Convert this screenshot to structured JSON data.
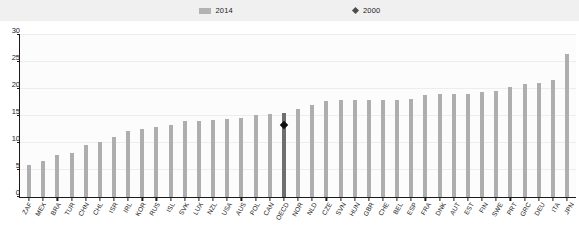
{
  "legend": {
    "items": [
      {
        "label": "2014",
        "marker": "bar-swatch-icon",
        "color": "#b3b3b3"
      },
      {
        "label": "2000",
        "marker": "diamond-marker-icon",
        "color": "#4d4d4d"
      }
    ]
  },
  "chart_data": {
    "type": "bar",
    "title": "",
    "subtitle": "",
    "xlabel": "",
    "ylabel": "",
    "ylim": [
      0,
      30
    ],
    "yticks": [
      0,
      5,
      10,
      15,
      20,
      25,
      30
    ],
    "grid": true,
    "legend_position": "top-center",
    "highlight_category": "OECD",
    "categories": [
      "ZAF",
      "MEX",
      "BRA",
      "TUR",
      "CHN",
      "CHL",
      "ISR",
      "IRL",
      "KOR",
      "RUS",
      "ISL",
      "SVK",
      "LUX",
      "NZL",
      "USA",
      "AUS",
      "POL",
      "CAN",
      "OECD",
      "NOR",
      "NLD",
      "CZE",
      "SVN",
      "HUN",
      "GBR",
      "CHE",
      "BEL",
      "ESP",
      "FRA",
      "DNK",
      "AUT",
      "EST",
      "FIN",
      "SWE",
      "PRT",
      "GRC",
      "DEU",
      "ITA",
      "JPN"
    ],
    "series": [
      {
        "name": "2014",
        "type": "bar",
        "color": "#aeaeae",
        "values": [
          5.9,
          6.7,
          7.7,
          8.2,
          9.6,
          10.2,
          11.1,
          12.3,
          12.6,
          13.0,
          13.4,
          14.0,
          14.1,
          14.3,
          14.4,
          14.6,
          15.2,
          15.4,
          15.6,
          16.3,
          17.1,
          17.7,
          17.9,
          17.9,
          17.9,
          17.9,
          18.0,
          18.1,
          18.8,
          19.0,
          19.0,
          19.1,
          19.5,
          19.7,
          20.3,
          21.0,
          21.2,
          21.6,
          26.5
        ]
      },
      {
        "name": "2000",
        "type": "scatter",
        "marker": "diamond",
        "color": "#101010",
        "points": [
          {
            "category": "OECD",
            "value": 13.3
          }
        ]
      }
    ]
  }
}
